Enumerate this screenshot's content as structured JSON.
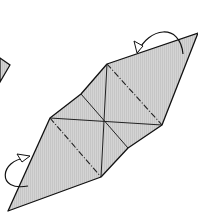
{
  "diagram": {
    "type": "origami-fold-step",
    "colors": {
      "paper_fill": "#d4d4d4",
      "outline": "#111111",
      "background": "#ffffff"
    },
    "outline_points": "198,33 162,125 128,148 101,177 8,211 50,118 81,94 107,64",
    "valley_creases": [
      {
        "x1": 107,
        "y1": 64,
        "x2": 101,
        "y2": 177
      },
      {
        "x1": 50,
        "y1": 118,
        "x2": 162,
        "y2": 125
      },
      {
        "x1": 81,
        "y1": 94,
        "x2": 128,
        "y2": 148
      }
    ],
    "mountain_creases": [
      {
        "x1": 107,
        "y1": 64,
        "x2": 162,
        "y2": 125
      },
      {
        "x1": 50,
        "y1": 118,
        "x2": 101,
        "y2": 177
      }
    ],
    "arrows": [
      {
        "name": "fold-behind-arrow-top",
        "path": "M 138 50 C 150 28, 180 22, 183 52"
      },
      {
        "name": "fold-behind-arrow-bottom",
        "path": "M 24 156 C 0 162, -4 190, 26 186"
      }
    ],
    "partial_previous_step": "0,58 10,65 0,82"
  }
}
